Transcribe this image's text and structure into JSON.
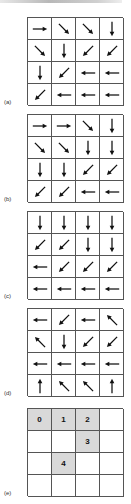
{
  "figure": {
    "panels": [
      {
        "label": "(a)",
        "top": 17,
        "type": "arrows",
        "cells": [
          [
            "right",
            "down-right",
            "down-right",
            "down"
          ],
          [
            "down-right",
            "down",
            "down-left",
            "down-left"
          ],
          [
            "down",
            "down-left",
            "left",
            "left"
          ],
          [
            "down-left",
            "left",
            "left",
            "left"
          ]
        ]
      },
      {
        "label": "(b)",
        "top": 114,
        "type": "arrows",
        "cells": [
          [
            "right",
            "right",
            "down-right",
            "down"
          ],
          [
            "down-right",
            "down-right",
            "down",
            "down"
          ],
          [
            "down",
            "down",
            "down-left",
            "down-left"
          ],
          [
            "down-left",
            "down-left",
            "left",
            "left"
          ]
        ]
      },
      {
        "label": "(c)",
        "top": 211,
        "type": "arrows",
        "cells": [
          [
            "down",
            "down",
            "down",
            "down"
          ],
          [
            "down-left",
            "down-left",
            "down",
            "down"
          ],
          [
            "left",
            "down-left",
            "down-left",
            "down-left"
          ],
          [
            "left",
            "left",
            "left",
            "left"
          ]
        ]
      },
      {
        "label": "(d)",
        "top": 308,
        "type": "arrows",
        "cells": [
          [
            "left",
            "down-left",
            "left",
            "up-left"
          ],
          [
            "up-left",
            "down",
            "down-left",
            "down-left"
          ],
          [
            "left",
            "left",
            "left",
            "left"
          ],
          [
            "up",
            "up-left",
            "up-left",
            "up"
          ]
        ]
      },
      {
        "label": "(e)",
        "top": 408,
        "type": "numbers",
        "shade_color": "#d9d9d9",
        "cells": [
          [
            {
              "text": "0",
              "shaded": true
            },
            {
              "text": "1",
              "shaded": true
            },
            {
              "text": "2",
              "shaded": true
            },
            {
              "text": "",
              "shaded": false
            }
          ],
          [
            {
              "text": "",
              "shaded": false
            },
            {
              "text": "",
              "shaded": false
            },
            {
              "text": "3",
              "shaded": true
            },
            {
              "text": "",
              "shaded": false
            }
          ],
          [
            {
              "text": "",
              "shaded": false
            },
            {
              "text": "4",
              "shaded": true
            },
            {
              "text": "",
              "shaded": false
            },
            {
              "text": "",
              "shaded": false
            }
          ],
          [
            {
              "text": "",
              "shaded": false
            },
            {
              "text": "",
              "shaded": false
            },
            {
              "text": "",
              "shaded": false
            },
            {
              "text": "",
              "shaded": false
            }
          ]
        ]
      }
    ]
  }
}
